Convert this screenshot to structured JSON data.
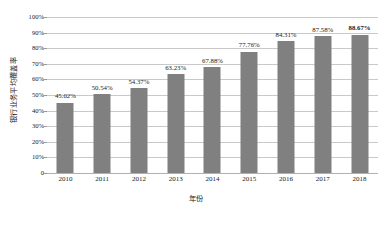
{
  "chart_data": {
    "type": "bar",
    "title": "",
    "xlabel": "年份",
    "ylabel": "银行业务平均覆盖率",
    "categories": [
      "2010",
      "2011",
      "2012",
      "2013",
      "2014",
      "2015",
      "2016",
      "2017",
      "2018"
    ],
    "values": [
      45.02,
      50.54,
      54.37,
      63.23,
      67.88,
      77.76,
      84.31,
      87.58,
      88.67
    ],
    "data_labels": [
      "45.02%",
      "50.54%",
      "54.37%",
      "63.23%",
      "67.88%",
      "77.76%",
      "84.31%",
      "87.58%",
      "88.67%"
    ],
    "emphasized_index": 8,
    "ylim": [
      0,
      100
    ],
    "ytick_values": [
      0,
      10,
      20,
      30,
      40,
      50,
      60,
      70,
      80,
      90,
      100
    ],
    "ytick_labels": [
      "0",
      "10%",
      "20%",
      "30%",
      "40%",
      "50%",
      "60%",
      "70%",
      "80%",
      "90%",
      "100%"
    ],
    "grid": true,
    "legend": false,
    "bar_color": "#808080",
    "grid_color": "#c9c9c9",
    "background_color": "#ffffff"
  }
}
